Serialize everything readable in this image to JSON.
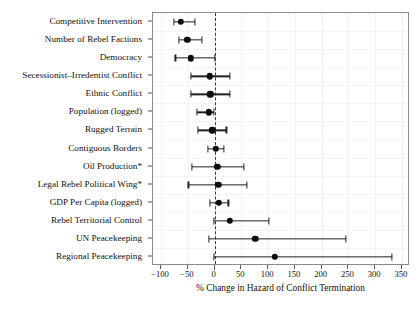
{
  "chart_data": {
    "type": "scatter",
    "subtype": "coefficient-forest-plot",
    "title": "",
    "xlabel": "% Change in Hazard of Conflict Termination",
    "ylabel": "",
    "xlim": [
      -115,
      365
    ],
    "xticks": [
      -100,
      -50,
      0,
      50,
      100,
      150,
      200,
      250,
      300,
      350
    ],
    "xticklabels": [
      "−100",
      "−50",
      "0",
      "50",
      "100",
      "150",
      "200",
      "250",
      "300",
      "350"
    ],
    "grid": true,
    "legend": null,
    "reference_line": 0,
    "reference_line_style": "dashed",
    "marker": "filled-circle",
    "marker_color": "#0d0d0d",
    "line_color": "#202020",
    "categories": [
      "Competitive Intervention",
      "Number of Rebel Factions",
      "Democracy",
      "Secessionist–Irredentist Conflict",
      "Ethnic Conflict",
      "Population (logged)",
      "Rugged Terrain",
      "Contiguous Borders",
      "Oil Production*",
      "Legal Rebel Political Wing*",
      "GDP Per Capita (logged)",
      "Rebel Territorial Control",
      "UN Peacekeeping",
      "Regional Peacekeeping"
    ],
    "points": [
      {
        "label": "Competitive Intervention",
        "estimate": -63,
        "ci_low": -76,
        "ci_high": -37
      },
      {
        "label": "Number of Rebel Factions",
        "estimate": -51,
        "ci_low": -66,
        "ci_high": -24
      },
      {
        "label": "Democracy",
        "estimate": -44,
        "ci_low": -73,
        "ci_high": 0
      },
      {
        "label": "Secessionist–Irredentist Conflict",
        "estimate": -9,
        "ci_low": -44,
        "ci_high": 28
      },
      {
        "label": "Ethnic Conflict",
        "estimate": -8,
        "ci_low": -44,
        "ci_high": 28
      },
      {
        "label": "Population (logged)",
        "estimate": -11,
        "ci_low": -33,
        "ci_high": -1
      },
      {
        "label": "Rugged Terrain",
        "estimate": -4,
        "ci_low": -31,
        "ci_high": 22
      },
      {
        "label": "Contiguous Borders",
        "estimate": 2,
        "ci_low": -13,
        "ci_high": 17
      },
      {
        "label": "Oil Production*",
        "estimate": 5,
        "ci_low": -43,
        "ci_high": 55
      },
      {
        "label": "Legal Rebel Political Wing*",
        "estimate": 7,
        "ci_low": -49,
        "ci_high": 61
      },
      {
        "label": "GDP Per Capita (logged)",
        "estimate": 8,
        "ci_low": -8,
        "ci_high": 26
      },
      {
        "label": "Rebel Territorial Control",
        "estimate": 29,
        "ci_low": -1,
        "ci_high": 101
      },
      {
        "label": "UN Peacekeeping",
        "estimate": 76,
        "ci_low": -10,
        "ci_high": 246
      },
      {
        "label": "Regional Peacekeeping",
        "estimate": 113,
        "ci_low": -1,
        "ci_high": 331
      }
    ]
  }
}
